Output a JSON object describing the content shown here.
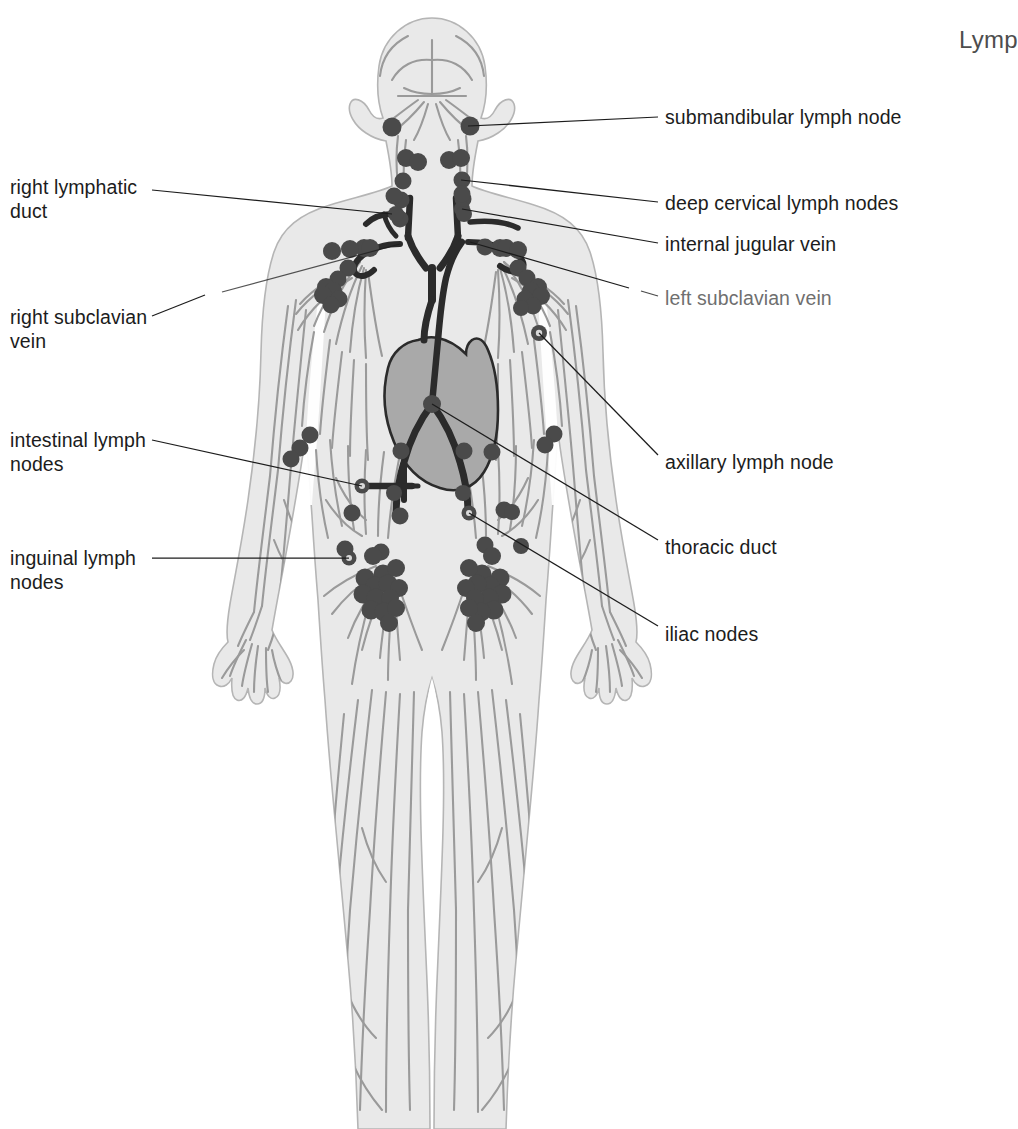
{
  "page": {
    "header_text": "Lymp",
    "background_color": "#ffffff"
  },
  "colors": {
    "body_fill": "#e9e9e9",
    "body_outline": "#b5b5b5",
    "vessel": "#9a9a9a",
    "node_fill": "#4a4a4a",
    "duct_dark": "#2b2b2b",
    "heart_fill": "#a9a9a9",
    "heart_outline": "#2b2b2b",
    "leader_line": "#1c1c1c",
    "label_text": "#1c1c1c",
    "header_text": "#4d4d4d"
  },
  "labels": {
    "left": [
      {
        "id": "right-lymphatic-duct",
        "text": "right lymphatic\nduct",
        "x": 10,
        "y": 175,
        "leader": {
          "x1": 152,
          "y1": 190,
          "x2": 392,
          "y2": 214
        }
      },
      {
        "id": "right-subclavian-vein",
        "text": "right subclavian\nvein",
        "x": 10,
        "y": 305,
        "leader_path": "M 152 316 L 205 295 M 222 292 L 400 244"
      },
      {
        "id": "intestinal-lymph-nodes",
        "text": "intestinal lymph\nnodes",
        "x": 10,
        "y": 428,
        "leader": {
          "x1": 152,
          "y1": 440,
          "x2": 362,
          "y2": 486
        }
      },
      {
        "id": "inguinal-lymph-nodes",
        "text": "inguinal lymph\nnodes",
        "x": 10,
        "y": 546,
        "leader": {
          "x1": 152,
          "y1": 558,
          "x2": 349,
          "y2": 558
        }
      }
    ],
    "right": [
      {
        "id": "submandibular-lymph-node",
        "text": "submandibular lymph node",
        "x": 665,
        "y": 105,
        "leader": {
          "x1": 658,
          "y1": 117,
          "x2": 468,
          "y2": 126
        }
      },
      {
        "id": "deep-cervical-lymph-nodes",
        "text": "deep cervical lymph nodes",
        "x": 665,
        "y": 191,
        "leader": {
          "x1": 658,
          "y1": 202,
          "x2": 461,
          "y2": 180
        }
      },
      {
        "id": "internal-jugular-vein",
        "text": "internal jugular vein",
        "x": 665,
        "y": 232,
        "leader": {
          "x1": 658,
          "y1": 243,
          "x2": 462,
          "y2": 209
        }
      },
      {
        "id": "left-subclavian-vein",
        "text": "left subclavian vein",
        "x": 665,
        "y": 286,
        "faded": true,
        "leader_path": "M 658 296 L 640 291 M 628 288 L 470 242"
      },
      {
        "id": "axillary-lymph-node",
        "text": "axillary lymph node",
        "x": 665,
        "y": 450,
        "leader": {
          "x1": 658,
          "y1": 455,
          "x2": 539,
          "y2": 333
        }
      },
      {
        "id": "thoracic-duct",
        "text": "thoracic duct",
        "x": 665,
        "y": 535,
        "leader": {
          "x1": 658,
          "y1": 540,
          "x2": 432,
          "y2": 404
        }
      },
      {
        "id": "iliac-nodes",
        "text": "iliac nodes",
        "x": 665,
        "y": 622,
        "leader": {
          "x1": 658,
          "y1": 626,
          "x2": 469,
          "y2": 513
        }
      }
    ]
  },
  "anatomy": {
    "structures": [
      "head",
      "neck",
      "torso",
      "arms",
      "hands",
      "legs",
      "heart",
      "thoracic-duct",
      "cisterna-chyli",
      "right-lymphatic-duct",
      "subclavian-veins",
      "internal-jugular-veins"
    ],
    "node_groups": [
      {
        "name": "submandibular",
        "count": 2
      },
      {
        "name": "deep-cervical-left",
        "count": 5
      },
      {
        "name": "deep-cervical-right",
        "count": 6
      },
      {
        "name": "supraclavicular",
        "count": 4
      },
      {
        "name": "axillary-left",
        "count": 9
      },
      {
        "name": "axillary-right",
        "count": 10
      },
      {
        "name": "abdominal-left",
        "count": 5
      },
      {
        "name": "abdominal-right",
        "count": 6
      },
      {
        "name": "intestinal",
        "count": 4
      },
      {
        "name": "iliac",
        "count": 4
      },
      {
        "name": "inguinal-left",
        "count": 14
      },
      {
        "name": "inguinal-right",
        "count": 14
      }
    ]
  }
}
